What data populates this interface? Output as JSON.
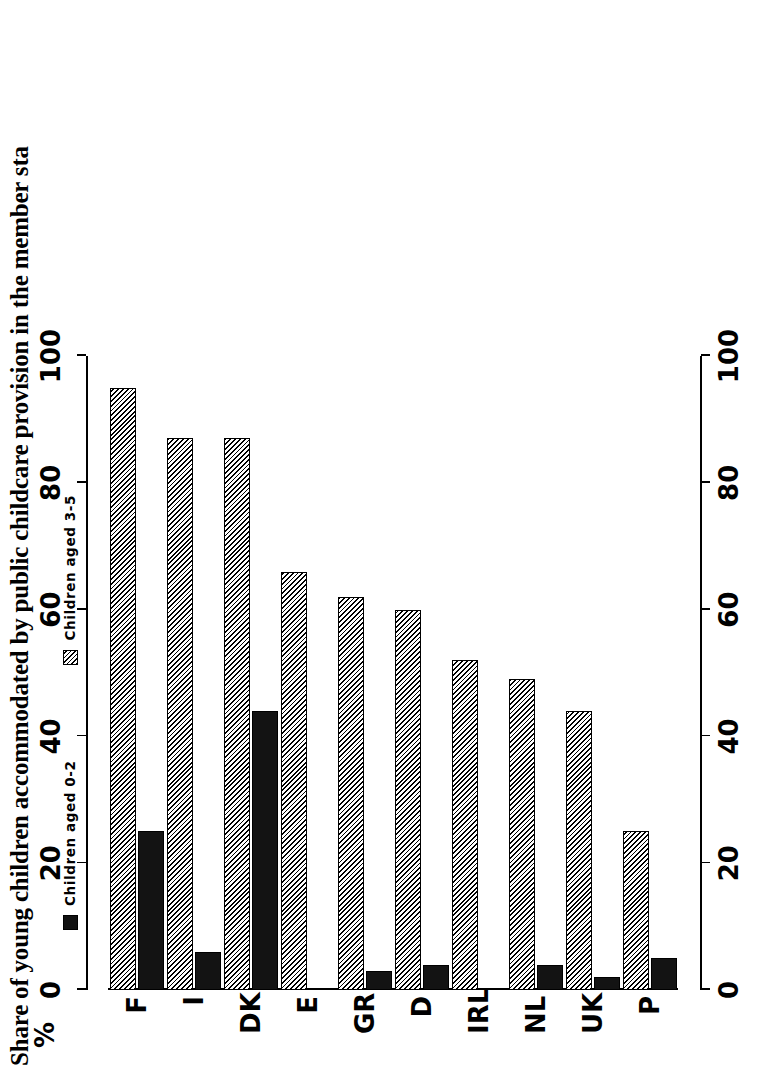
{
  "title": "Share of young children accommodated by public childcare provision in the member sta",
  "axis_unit_label": "%",
  "legend": {
    "position": "top-left",
    "entries": [
      {
        "label": "Children aged 0-2",
        "swatch": "solid-black-square",
        "color": "#111111"
      },
      {
        "label": "Children aged 3-5",
        "swatch": "hatched-square",
        "color": "#f2f2f2"
      }
    ]
  },
  "chart_data": {
    "type": "bar",
    "orientation": "horizontal",
    "title": "Share of young children accommodated by public childcare provision in the member sta",
    "xlabel": "%",
    "ylabel": "",
    "xlim": [
      0,
      100
    ],
    "ticks": [
      0,
      20,
      40,
      60,
      80,
      100
    ],
    "grid": false,
    "legend_position": "top-left",
    "categories": [
      "F",
      "I",
      "DK",
      "E",
      "GR",
      "D",
      "IRL",
      "NL",
      "UK",
      "P"
    ],
    "series": [
      {
        "name": "Children aged 0-2",
        "values": [
          25,
          6,
          44,
          0,
          3,
          4,
          0,
          4,
          2,
          5
        ]
      },
      {
        "name": "Children aged 3-5",
        "values": [
          95,
          87,
          87,
          66,
          62,
          60,
          52,
          49,
          44,
          25
        ]
      }
    ]
  }
}
